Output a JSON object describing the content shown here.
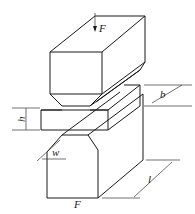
{
  "diagram": {
    "type": "v-notch-punch-test-schematic",
    "labels": {
      "force_top": "F",
      "force_bottom": "F",
      "height": "h",
      "width_b": "b",
      "notch_width": "w",
      "length": "l"
    }
  }
}
